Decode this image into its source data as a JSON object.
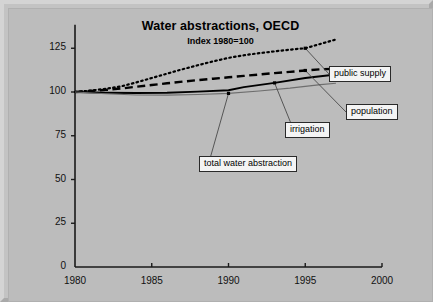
{
  "chart_data": {
    "type": "line",
    "title": "Water abstractions, OECD",
    "subtitle": "Index 1980=100",
    "xlabel": "",
    "ylabel": "",
    "xlim": [
      1980,
      2000
    ],
    "ylim": [
      0,
      135
    ],
    "xticks": [
      1980,
      1985,
      1990,
      1995,
      2000
    ],
    "yticks": [
      0,
      25,
      50,
      75,
      100,
      125
    ],
    "xtick_labels": [
      "1980",
      "1985",
      "1990",
      "1995",
      "2000"
    ],
    "ytick_labels": [
      "0",
      "25",
      "50",
      "75",
      "100",
      "125"
    ],
    "grid": false,
    "legend": "callout-labels",
    "series": [
      {
        "name": "public supply",
        "style": "dotted",
        "color": "#000000",
        "x": [
          1980,
          1981,
          1982,
          1983,
          1984,
          1985,
          1986,
          1987,
          1988,
          1989,
          1990,
          1991,
          1992,
          1993,
          1994,
          1995,
          1996,
          1997
        ],
        "y": [
          100,
          100.8,
          101.8,
          103.2,
          105.5,
          108.0,
          110.5,
          113.0,
          115.3,
          117.5,
          119.5,
          121.0,
          122.2,
          123.2,
          124.2,
          125.0,
          127.5,
          130.0
        ]
      },
      {
        "name": "population",
        "style": "dashed",
        "color": "#000000",
        "x": [
          1980,
          1981,
          1982,
          1983,
          1984,
          1985,
          1986,
          1987,
          1988,
          1989,
          1990,
          1991,
          1992,
          1993,
          1994,
          1995,
          1996,
          1997
        ],
        "y": [
          100,
          100.6,
          101.2,
          102.0,
          103.0,
          104.0,
          105.0,
          105.9,
          106.8,
          107.6,
          108.4,
          109.2,
          110.0,
          110.8,
          111.5,
          112.3,
          113.0,
          113.2
        ]
      },
      {
        "name": "total water abstraction",
        "style": "solid",
        "color": "#000000",
        "x": [
          1980,
          1982,
          1984,
          1986,
          1988,
          1990,
          1991,
          1993,
          1995,
          1997
        ],
        "y": [
          100,
          99.6,
          99.4,
          99.6,
          100.2,
          101.0,
          102.8,
          105.2,
          108.0,
          110.0
        ]
      },
      {
        "name": "irrigation",
        "style": "solid-thin",
        "color": "#6e6e6e",
        "x": [
          1980,
          1982,
          1984,
          1986,
          1988,
          1990,
          1992,
          1994,
          1996,
          1997
        ],
        "y": [
          100,
          99.0,
          98.3,
          98.2,
          98.6,
          99.2,
          100.6,
          102.2,
          104.2,
          105.0
        ]
      }
    ],
    "markers": [
      {
        "series": "public supply",
        "x": 1995,
        "y": 125.0
      },
      {
        "series": "population",
        "x": 1995,
        "y": 112.3
      },
      {
        "series": "total water abstraction",
        "x": 1993,
        "y": 105.2
      },
      {
        "series": "irrigation",
        "x": 1990,
        "y": 99.2
      }
    ],
    "annotations": [
      {
        "label": "public supply",
        "anchor_x": 1995,
        "anchor_y": 125.0,
        "box_x": 320,
        "box_y": 57
      },
      {
        "label": "population",
        "anchor_x": 1995,
        "anchor_y": 112.3,
        "box_x": 337,
        "box_y": 95
      },
      {
        "label": "irrigation",
        "anchor_x": 1993,
        "anchor_y": 105.2,
        "box_x": 276,
        "box_y": 113
      },
      {
        "label": "total water abstraction",
        "anchor_x": 1990,
        "anchor_y": 99.2,
        "box_x": 190,
        "box_y": 147
      }
    ]
  },
  "colors": {
    "background": "#bcbcbc",
    "frame": "#c3c3c3",
    "axis": "#1a1a1a",
    "series_dark": "#000000",
    "series_gray": "#6e6e6e",
    "callout_bg": "#f4f4f4"
  }
}
